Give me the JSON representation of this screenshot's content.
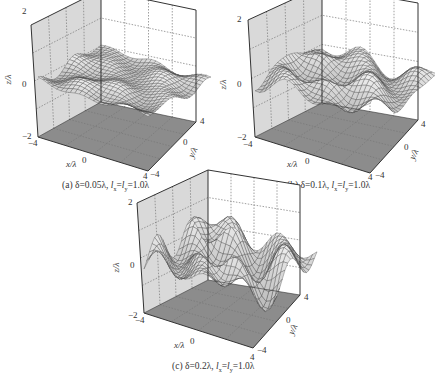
{
  "figure": {
    "panels": [
      {
        "id": "a",
        "caption": "(a) δ=0.05λ, lx=ly=1.0λ",
        "caption_parts": {
          "prefix": "(a) δ=0.05λ, ",
          "lx": "l",
          "sub_x": "x",
          "eq": "=",
          "ly": "l",
          "sub_y": "y",
          "suffix": "=1.0λ"
        }
      },
      {
        "id": "b",
        "caption": "(b) δ=0.1λ, lx=ly=1.0λ",
        "caption_parts": {
          "prefix": "(b) δ=0.1λ, ",
          "lx": "l",
          "sub_x": "x",
          "eq": "=",
          "ly": "l",
          "sub_y": "y",
          "suffix": "=1.0λ"
        }
      },
      {
        "id": "c",
        "caption": "(c) δ=0.2λ, lx=ly=1.0λ",
        "caption_parts": {
          "prefix": "(c) δ=0.2λ, ",
          "lx": "l",
          "sub_x": "x",
          "eq": "=",
          "ly": "l",
          "sub_y": "y",
          "suffix": "=1.0λ"
        }
      }
    ],
    "axes": {
      "z_label": "z/λ",
      "x_label": "x/λ",
      "y_label": "y/λ",
      "z_ticks": [
        "2",
        "0",
        "−2"
      ],
      "x_ticks": [
        "−4",
        "0",
        "4"
      ],
      "y_ticks": [
        "4",
        "0",
        "−4"
      ]
    }
  },
  "chart_data": [
    {
      "type": "surface3d",
      "title": "(a) δ=0.05λ, lx=ly=1.0λ",
      "xlabel": "x/λ",
      "ylabel": "y/λ",
      "zlabel": "z/λ",
      "xlim": [
        -4,
        4
      ],
      "ylim": [
        -4,
        4
      ],
      "zlim": [
        -2,
        2
      ],
      "xticks": [
        -4,
        0,
        4
      ],
      "yticks": [
        -4,
        0,
        4
      ],
      "zticks": [
        -2,
        0,
        2
      ],
      "rms_height": 0.05,
      "correlation_length_x": 1.0,
      "correlation_length_y": 1.0,
      "surface_amplitude_approx": 0.15,
      "grid": true
    },
    {
      "type": "surface3d",
      "title": "(b) δ=0.1λ, lx=ly=1.0λ",
      "xlabel": "x/λ",
      "ylabel": "y/λ",
      "zlabel": "z/λ",
      "xlim": [
        -4,
        4
      ],
      "ylim": [
        -4,
        4
      ],
      "zlim": [
        -2,
        2
      ],
      "xticks": [
        -4,
        0,
        4
      ],
      "yticks": [
        -4,
        0,
        4
      ],
      "zticks": [
        -2,
        0,
        2
      ],
      "rms_height": 0.1,
      "correlation_length_x": 1.0,
      "correlation_length_y": 1.0,
      "surface_amplitude_approx": 0.3,
      "grid": true
    },
    {
      "type": "surface3d",
      "title": "(c) δ=0.2λ, lx=ly=1.0λ",
      "xlabel": "x/λ",
      "ylabel": "y/λ",
      "zlabel": "z/λ",
      "xlim": [
        -4,
        4
      ],
      "ylim": [
        -4,
        4
      ],
      "zlim": [
        -2,
        2
      ],
      "xticks": [
        -4,
        0,
        4
      ],
      "yticks": [
        -4,
        0,
        4
      ],
      "zticks": [
        -2,
        0,
        2
      ],
      "rms_height": 0.2,
      "correlation_length_x": 1.0,
      "correlation_length_y": 1.0,
      "surface_amplitude_approx": 0.6,
      "grid": true
    }
  ],
  "colors": {
    "left_wall": "#d9d9d9",
    "floor": "#8c8c8c",
    "frame": "#333333",
    "mesh_fill": "#e8e8e8",
    "mesh_line": "#444444",
    "grid": "#777777"
  }
}
